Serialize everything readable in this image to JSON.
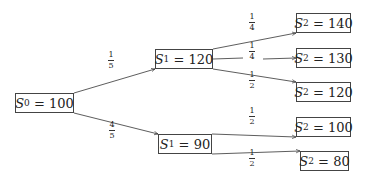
{
  "diagram": {
    "type": "probability-tree",
    "nodes": [
      {
        "id": "s0",
        "var": "S",
        "sub": "0",
        "value": "100",
        "x": 15,
        "y": 93,
        "w": 59,
        "h": 20
      },
      {
        "id": "s1a",
        "var": "S",
        "sub": "1",
        "value": "120",
        "x": 155,
        "y": 49,
        "w": 58,
        "h": 20
      },
      {
        "id": "s1b",
        "var": "S",
        "sub": "1",
        "value": "90",
        "x": 158,
        "y": 134,
        "w": 54,
        "h": 20
      },
      {
        "id": "s2a",
        "var": "S",
        "sub": "2",
        "value": "140",
        "x": 296,
        "y": 13,
        "w": 55,
        "h": 20
      },
      {
        "id": "s2b",
        "var": "S",
        "sub": "2",
        "value": "130",
        "x": 296,
        "y": 48,
        "w": 55,
        "h": 20
      },
      {
        "id": "s2c",
        "var": "S",
        "sub": "2",
        "value": "120",
        "x": 296,
        "y": 82,
        "w": 55,
        "h": 20
      },
      {
        "id": "s2d",
        "var": "S",
        "sub": "2",
        "value": "100",
        "x": 296,
        "y": 117,
        "w": 55,
        "h": 20
      },
      {
        "id": "s2e",
        "var": "S",
        "sub": "2",
        "value": "80",
        "x": 300,
        "y": 151,
        "w": 49,
        "h": 20
      }
    ],
    "edges": [
      {
        "from": "s0",
        "to": "s1a",
        "num": "1",
        "den": "5",
        "lx": 112,
        "ly": 60
      },
      {
        "from": "s0",
        "to": "s1b",
        "num": "4",
        "den": "5",
        "lx": 113,
        "ly": 130
      },
      {
        "from": "s1a",
        "to": "s2a",
        "num": "1",
        "den": "4",
        "lx": 253,
        "ly": 22
      },
      {
        "from": "s1a",
        "to": "s2b",
        "num": "1",
        "den": "4",
        "lx": 253,
        "ly": 51
      },
      {
        "from": "s1a",
        "to": "s2c",
        "num": "1",
        "den": "2",
        "lx": 253,
        "ly": 80
      },
      {
        "from": "s1b",
        "to": "s2d",
        "num": "1",
        "den": "2",
        "lx": 253,
        "ly": 116
      },
      {
        "from": "s1b",
        "to": "s2e",
        "num": "1",
        "den": "2",
        "lx": 253,
        "ly": 158
      }
    ]
  }
}
